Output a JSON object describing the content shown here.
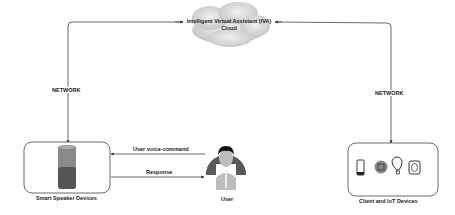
{
  "cloud": {
    "line1": "Intelligent Virtual Assistant (IVA)",
    "line2": "Cloud"
  },
  "edges": {
    "left_network": "NETWORK",
    "right_network": "NETWORK",
    "voice_command": "User voice-command",
    "response": "Response"
  },
  "nodes": {
    "smart_speaker": {
      "label": "Smart Speaker Devices"
    },
    "user": {
      "label": "User"
    },
    "client_iot": {
      "label": "Client and IoT Devices",
      "icons": [
        "smartphone-icon",
        "processor-icon",
        "lightbulb-icon",
        "chip-icon"
      ]
    }
  },
  "colors": {
    "line": "#444444",
    "cloud": "#d9d9d9",
    "speaker_top": "#8a8a8a",
    "speaker_bottom": "#555555",
    "avatar_bg": "#5a5a5a"
  }
}
